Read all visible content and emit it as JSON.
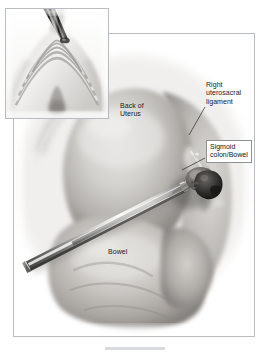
{
  "figure": {
    "name": "laparoscopic-pelvic-anatomy-illustration",
    "style": "grayscale medical illustration",
    "background_color": "#ffffff",
    "frame_border_color": "#b9bcc0"
  },
  "main_panel": {
    "name": "main-surgical-view",
    "description": "Grayscale laparoscopic view of the posterior pelvis showing the back of the uterus, sigmoid colon, bowel and an instrument grasping a lesion at the right uterosacral ligament"
  },
  "inset_panel": {
    "name": "tissue-cross-section-inset",
    "description": "Magnified cross-section of layered tissue with instrument tip entering from above"
  },
  "labels": {
    "back_of_uterus": "Back of\nUterus",
    "right_uterosacral_ligament": "Right\nuterosacral\nligament",
    "bowel": "Bowel"
  },
  "callouts": {
    "sigmoid_colon_bowel": "Sigmoid\ncolon/Bowel"
  },
  "colors": {
    "label_text": "#1b1b1b",
    "callout_border": "#8d9196",
    "callout_background": "#ffffff",
    "leader_line": "#2a2a2a",
    "caption_rule": "#d8dadd"
  }
}
